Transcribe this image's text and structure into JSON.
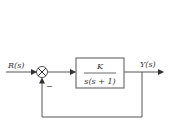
{
  "diagram": {
    "type": "closed-loop block diagram (unity negative feedback)",
    "input_label": "R(s)",
    "output_label": "Y(s)",
    "summing_junction": {
      "feedback_sign": "−"
    },
    "block": {
      "numerator": "K",
      "denominator": "s(s + 1)"
    },
    "colors": {
      "line": "#555555",
      "text": "#333333",
      "background": "#ffffff"
    }
  }
}
